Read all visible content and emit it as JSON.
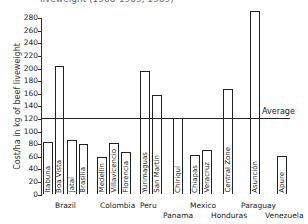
{
  "chart_data": {
    "type": "bar",
    "title": "liveweight (1968-1969, 1969)",
    "xlabel": "",
    "ylabel": "Cost/ha in kg of beef liveweight",
    "ylim": [
      0,
      280
    ],
    "yticks": [
      0,
      20,
      40,
      60,
      80,
      100,
      120,
      140,
      160,
      180,
      200,
      220,
      240,
      260,
      280
    ],
    "grid": false,
    "legend": null,
    "reference_lines": [
      {
        "label": "Average",
        "value": 121
      }
    ],
    "categories": [
      "Itabuna",
      "Boa Vista",
      "Jataí",
      "Brasília",
      "Medellín",
      "Villavicencio",
      "Florencia",
      "Yurimaguas",
      "San Martín",
      "Chiriquí",
      "Chiapas",
      "Veracruz",
      "Central Zone",
      "Asunción",
      "Apure"
    ],
    "groups": [
      {
        "country": "Brazil",
        "sites": [
          "Itabuna",
          "Boa Vista",
          "Jataí",
          "Brasília"
        ]
      },
      {
        "country": "Colombia",
        "sites": [
          "Medellín",
          "Villavicencio",
          "Florencia"
        ]
      },
      {
        "country": "Peru",
        "sites": [
          "Yurimaguas",
          "San Martín"
        ]
      },
      {
        "country": "Panama",
        "sites": [
          "Chiriquí"
        ]
      },
      {
        "country": "Mexico",
        "sites": [
          "Chiapas",
          "Veracruz"
        ]
      },
      {
        "country": "Honduras",
        "sites": [
          "Central Zone"
        ]
      },
      {
        "country": "Paraguay",
        "sites": [
          "Asunción"
        ]
      },
      {
        "country": "Venezuela",
        "sites": [
          "Apure"
        ]
      }
    ],
    "values": [
      84,
      204,
      87,
      80,
      60,
      82,
      68,
      196,
      158,
      122,
      63,
      70,
      167,
      292,
      61
    ]
  },
  "layout": {
    "y_zero_px": 194.5,
    "px_per_unit": 0.63,
    "bars": [
      {
        "label": "Itabuna",
        "x": 43,
        "w": 10
      },
      {
        "label": "Boa Vista",
        "x": 55,
        "w": 9
      },
      {
        "label": "Jataí",
        "x": 67,
        "w": 10
      },
      {
        "label": "Brasília",
        "x": 79,
        "w": 9
      },
      {
        "label": "Medellín",
        "x": 97,
        "w": 10
      },
      {
        "label": "Villavicencio",
        "x": 109,
        "w": 10
      },
      {
        "label": "Florencia",
        "x": 121,
        "w": 10
      },
      {
        "label": "Yurimaguas",
        "x": 140,
        "w": 10
      },
      {
        "label": "San Martín",
        "x": 152,
        "w": 10
      },
      {
        "label": "Chiriquí",
        "x": 173,
        "w": 10
      },
      {
        "label": "Chiapas",
        "x": 190,
        "w": 10
      },
      {
        "label": "Veracruz",
        "x": 202,
        "w": 10
      },
      {
        "label": "Central Zone",
        "x": 223,
        "w": 10
      },
      {
        "label": "Asunción",
        "x": 250,
        "w": 10
      },
      {
        "label": "Apure",
        "x": 277,
        "w": 10
      }
    ],
    "countries": [
      {
        "name": "Brazil",
        "x": 55,
        "y": 201
      },
      {
        "name": "Colombia",
        "x": 100,
        "y": 201
      },
      {
        "name": "Peru",
        "x": 140,
        "y": 201
      },
      {
        "name": "Panama",
        "x": 163,
        "y": 211
      },
      {
        "name": "Mexico",
        "x": 190,
        "y": 201
      },
      {
        "name": "Honduras",
        "x": 211,
        "y": 211
      },
      {
        "name": "Paraguay",
        "x": 241,
        "y": 201
      },
      {
        "name": "Venezuela",
        "x": 265,
        "y": 211
      }
    ]
  },
  "labels": {
    "title": "liveweight (1968-1969, 1969)",
    "ylabel": "Cost/ha in kg of beef liveweight",
    "average": "Average"
  }
}
